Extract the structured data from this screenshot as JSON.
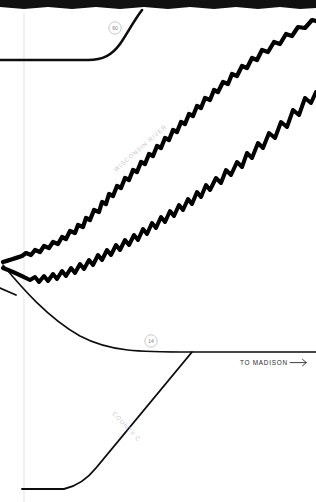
{
  "map": {
    "title": "Wisconsin River road map detail",
    "background_color": "#ffffff",
    "ink_color": "#000000",
    "label_color": "#c9c9c9",
    "features": {
      "river": {
        "name": "WISCONSIN RIVER",
        "label": "WISCONSIN RIVER",
        "label_rotation_deg": -41,
        "label_x": 116,
        "label_y": 172,
        "type": "river-channel",
        "bank_stroke_width": 4.2
      },
      "county_road": {
        "name": "COUNTY C",
        "label": "COUNTY C",
        "label_rotation_deg": 47,
        "label_x": 112,
        "label_y": 414,
        "type": "secondary-road",
        "stroke_width": 1.9
      },
      "direction_note": {
        "text": "TO MADISON",
        "arrow": "→",
        "x": 240,
        "y": 363
      }
    },
    "route_shields": [
      {
        "id": "shield-60",
        "number": "60",
        "route_name": "State Highway 60",
        "cx": 115,
        "cy": 28,
        "r": 6.2
      },
      {
        "id": "shield-14",
        "number": "14",
        "route_name": "US Highway 14",
        "cx": 151,
        "cy": 341,
        "r": 6.2
      }
    ],
    "roads": [
      {
        "id": "highway-60",
        "label": "Highway 60",
        "stroke_width": 2.6
      },
      {
        "id": "highway-14",
        "label": "Highway 14 to Madison",
        "stroke_width": 1.6
      },
      {
        "id": "county-c",
        "label": "County C",
        "stroke_width": 1.9
      },
      {
        "id": "spur-stub",
        "label": "unnamed spur",
        "stroke_width": 1.8
      }
    ],
    "artifacts": {
      "scan_band_top": "black scan edge band",
      "guide_line": "faint vertical page guide"
    }
  }
}
